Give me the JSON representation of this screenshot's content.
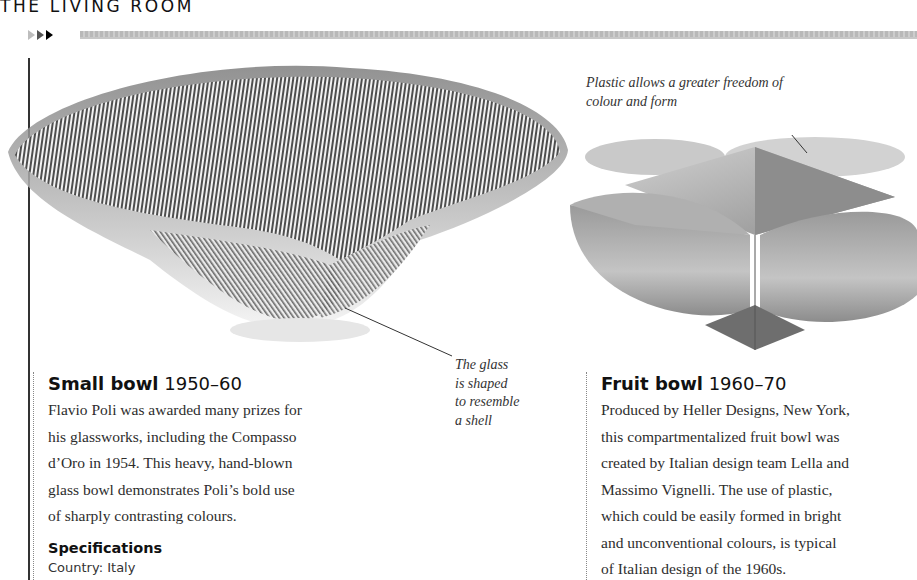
{
  "header": {
    "section_title": "THE LIVING ROOM",
    "nav_icons": [
      "arrow-light-icon",
      "arrow-mid-icon",
      "arrow-dark-icon"
    ]
  },
  "images": {
    "glass_bowl": {
      "alt": "Striped glass bowl with shell-like fold",
      "colors": {
        "stripe": "#4a4a4a",
        "glass": "#eeeeee"
      }
    },
    "fruit_bowl": {
      "alt": "Four-compartment plastic fruit bowl",
      "colors": {
        "body": "#b5b5b5",
        "shadow": "#7a7a7a"
      }
    }
  },
  "annotations": {
    "plastic": "Plastic allows a greater freedom of colour and form",
    "glass_lines": [
      "The glass",
      "is shaped",
      "to resemble",
      "a shell"
    ]
  },
  "items": [
    {
      "name": "Small bowl",
      "years": "1950–60",
      "body_lines": [
        "Flavio Poli was awarded many prizes for",
        "his glassworks, including the Compasso",
        "d’Oro in 1954. This heavy, hand-blown",
        "glass bowl demonstrates Poli’s bold use",
        "of sharply contrasting colours."
      ],
      "spec_heading": "Specifications",
      "specs": [
        "Country: Italy"
      ]
    },
    {
      "name": "Fruit bowl",
      "years": "1960–70",
      "body_lines": [
        "Produced by Heller Designs, New York,",
        "this compartmentalized fruit bowl was",
        "created by Italian design team Lella and",
        "Massimo Vignelli. The use of plastic,",
        "which could be easily formed in bright",
        "and unconventional colours, is typical",
        "of Italian design of the 1960s."
      ]
    }
  ]
}
